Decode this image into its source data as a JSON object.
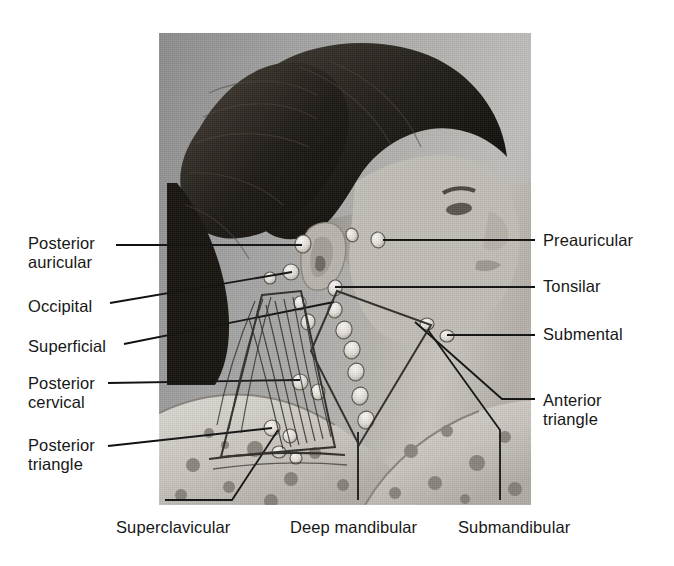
{
  "figure": {
    "background_color": "#ffffff",
    "leader_line_color": "#111111",
    "text_color": "#171717",
    "photo": {
      "x": 159,
      "y": 33,
      "width": 372,
      "height": 472,
      "tone": "black-and-white halftone print",
      "base_color": "#a8a6a2"
    }
  },
  "labels": {
    "left": [
      {
        "id": "posterior-auricular",
        "text": "Posterior\nauricular",
        "x": 28,
        "y": 234
      },
      {
        "id": "occipital",
        "text": "Occipital",
        "x": 28,
        "y": 297
      },
      {
        "id": "superficial",
        "text": "Superficial",
        "x": 28,
        "y": 337
      },
      {
        "id": "posterior-cervical",
        "text": "Posterior\ncervical",
        "x": 28,
        "y": 374
      },
      {
        "id": "posterior-triangle",
        "text": "Posterior\ntriangle",
        "x": 28,
        "y": 436
      }
    ],
    "right": [
      {
        "id": "preauricular",
        "text": "Preauricular",
        "x": 543,
        "y": 231
      },
      {
        "id": "tonsilar",
        "text": "Tonsilar",
        "x": 543,
        "y": 277
      },
      {
        "id": "submental",
        "text": "Submental",
        "x": 543,
        "y": 325
      },
      {
        "id": "anterior-triangle",
        "text": "Anterior\ntriangle",
        "x": 543,
        "y": 391
      }
    ],
    "bottom": [
      {
        "id": "supraclavicular",
        "text": "Superclavicular",
        "x": 116,
        "y": 518
      },
      {
        "id": "deep-mandibular",
        "text": "Deep mandibular",
        "x": 290,
        "y": 518
      },
      {
        "id": "submandibular",
        "text": "Submandibular",
        "x": 458,
        "y": 518
      }
    ]
  },
  "leader_lines": [
    {
      "id": "leader-posterior-auricular",
      "points": "116,245 302,245"
    },
    {
      "id": "leader-occipital",
      "points": "110,303 292,272"
    },
    {
      "id": "leader-superficial",
      "points": "124,344 334,302"
    },
    {
      "id": "leader-posterior-cervical",
      "points": "108,383 300,380"
    },
    {
      "id": "leader-posterior-triangle",
      "points": "108,446 272,428"
    },
    {
      "id": "leader-preauricular",
      "points": "535,240 383,240"
    },
    {
      "id": "leader-tonsilar",
      "points": "535,287 335,287"
    },
    {
      "id": "leader-submental",
      "points": "535,335 447,335"
    },
    {
      "id": "leader-anterior-triangle",
      "points": "535,399 502,399 415,322"
    },
    {
      "id": "leader-supraclavicular",
      "points": "165,500 232,500 278,430"
    },
    {
      "id": "leader-deep-mandibular",
      "points": "358,500 358,432"
    },
    {
      "id": "leader-submandibular",
      "points": "500,500 500,430 428,330"
    }
  ],
  "lymph_nodes": [
    {
      "id": "node-preauricular",
      "cx": 378,
      "cy": 240,
      "rx": 7,
      "ry": 8,
      "rot": -10
    },
    {
      "id": "node-auricular-upper",
      "cx": 352,
      "cy": 235,
      "rx": 6,
      "ry": 7,
      "rot": -20
    },
    {
      "id": "node-posterior-auricular",
      "cx": 303,
      "cy": 244,
      "rx": 8,
      "ry": 9,
      "rot": 10
    },
    {
      "id": "node-occipital",
      "cx": 291,
      "cy": 272,
      "rx": 8,
      "ry": 8,
      "rot": 0
    },
    {
      "id": "node-occipital-2",
      "cx": 270,
      "cy": 278,
      "rx": 6,
      "ry": 6,
      "rot": 0
    },
    {
      "id": "node-tonsilar",
      "cx": 335,
      "cy": 288,
      "rx": 7,
      "ry": 8,
      "rot": 15
    },
    {
      "id": "node-superficial-1",
      "cx": 335,
      "cy": 310,
      "rx": 7,
      "ry": 8,
      "rot": 15
    },
    {
      "id": "node-superficial-2",
      "cx": 344,
      "cy": 330,
      "rx": 8,
      "ry": 9,
      "rot": 20
    },
    {
      "id": "node-superficial-3",
      "cx": 352,
      "cy": 350,
      "rx": 8,
      "ry": 9,
      "rot": 20
    },
    {
      "id": "node-deep-1",
      "cx": 356,
      "cy": 372,
      "rx": 8,
      "ry": 9,
      "rot": 20
    },
    {
      "id": "node-deep-2",
      "cx": 360,
      "cy": 396,
      "rx": 8,
      "ry": 9,
      "rot": 20
    },
    {
      "id": "node-deep-3",
      "cx": 366,
      "cy": 420,
      "rx": 8,
      "ry": 9,
      "rot": 20
    },
    {
      "id": "node-submental",
      "cx": 447,
      "cy": 336,
      "rx": 7,
      "ry": 6,
      "rot": 0
    },
    {
      "id": "node-submandibular",
      "cx": 427,
      "cy": 324,
      "rx": 7,
      "ry": 6,
      "rot": 0
    },
    {
      "id": "node-cervical-1",
      "cx": 300,
      "cy": 303,
      "rx": 6,
      "ry": 7,
      "rot": 0
    },
    {
      "id": "node-cervical-2",
      "cx": 308,
      "cy": 322,
      "rx": 7,
      "ry": 8,
      "rot": 10
    },
    {
      "id": "node-cervical-3",
      "cx": 300,
      "cy": 382,
      "rx": 8,
      "ry": 8,
      "rot": 0
    },
    {
      "id": "node-cervical-4",
      "cx": 318,
      "cy": 392,
      "rx": 7,
      "ry": 8,
      "rot": 0
    },
    {
      "id": "node-posterior-triangle-1",
      "cx": 272,
      "cy": 428,
      "rx": 8,
      "ry": 8,
      "rot": 0
    },
    {
      "id": "node-posterior-triangle-2",
      "cx": 290,
      "cy": 436,
      "rx": 7,
      "ry": 7,
      "rot": 0
    },
    {
      "id": "node-supraclavicular-1",
      "cx": 279,
      "cy": 452,
      "rx": 7,
      "ry": 6,
      "rot": 0
    },
    {
      "id": "node-supraclavicular-2",
      "cx": 296,
      "cy": 458,
      "rx": 6,
      "ry": 6,
      "rot": 0
    }
  ],
  "anatomy_overlay": {
    "posterior_triangle": "262,300 300,296 330,418 252,452",
    "anterior_triangle": "336,292 430,322 360,436 312,350",
    "sternocleidomastoid": "300,296 336,292 366,430 326,440"
  }
}
